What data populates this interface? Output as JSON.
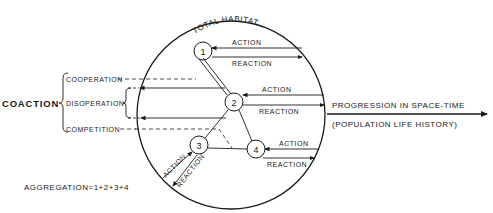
{
  "diagram": {
    "title_arc": "TOTAL HABITAT",
    "left_label": "COACTION",
    "coaction_types": [
      "COOPERATION",
      "DISOPERATION",
      "COMPETITION"
    ],
    "nodes": [
      {
        "id": "1",
        "label": "1"
      },
      {
        "id": "2",
        "label": "2"
      },
      {
        "id": "3",
        "label": "3"
      },
      {
        "id": "4",
        "label": "4"
      }
    ],
    "arrows": {
      "node1": {
        "action": "ACTION",
        "reaction": "REACTION"
      },
      "node2": {
        "action": "ACTION",
        "reaction": "REACTION"
      },
      "node3": {
        "action": "ACTION",
        "reaction": "REACTION"
      },
      "node4": {
        "action": "ACTION",
        "reaction": "REACTION"
      }
    },
    "progression": {
      "line1": "PROGRESSION IN SPACE-TIME",
      "line2": "(POPULATION LIFE HISTORY)"
    },
    "aggregation": "AGGREGATION=1+2+3+4",
    "colors": {
      "ink": "#1a1a1a",
      "background": "#ffffff"
    }
  }
}
